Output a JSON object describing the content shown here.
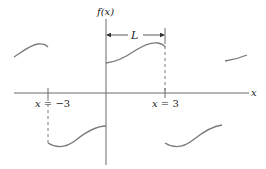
{
  "figure": {
    "type": "periodic-function-plot",
    "y_axis_label": "f(x)",
    "x_axis_label": "x",
    "period_label": "L",
    "ticks": {
      "left": {
        "label_var": "x",
        "label_eq": " = ",
        "label_val": "−3",
        "value": -3
      },
      "right": {
        "label_var": "x",
        "label_eq": " = ",
        "label_val": "3",
        "value": 3
      }
    },
    "colors": {
      "axis": "#6b6b6b",
      "curve": "#7a7a7a",
      "dash": "#7a7a7a",
      "text": "#222222"
    },
    "segments": [
      {
        "name": "segment-far-left",
        "x_range": [
          -6,
          -3
        ],
        "position": "above-axis"
      },
      {
        "name": "segment-left",
        "x_range": [
          -3,
          0
        ],
        "position": "below-axis"
      },
      {
        "name": "segment-center",
        "x_range": [
          0,
          3
        ],
        "position": "above-axis"
      },
      {
        "name": "segment-right",
        "x_range": [
          3,
          6
        ],
        "position": "below-axis"
      },
      {
        "name": "segment-far-right",
        "x_range": [
          6,
          9
        ],
        "position": "above-axis"
      }
    ]
  }
}
